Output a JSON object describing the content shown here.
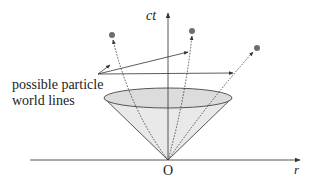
{
  "diagram": {
    "axes": {
      "vertical_label": "ct",
      "horizontal_label": "r",
      "origin_label": "O"
    },
    "annotation": {
      "line1": "possible particle",
      "line2": "world lines"
    },
    "elements": {
      "light_cone": "cone",
      "world_lines": [
        "world-line-left",
        "world-line-middle",
        "world-line-right"
      ],
      "event_points": 3
    },
    "colors": {
      "cone_fill": "#e6e6e6",
      "line": "#333333",
      "dot": "#6e6e6e"
    }
  }
}
